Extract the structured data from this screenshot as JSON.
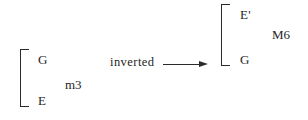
{
  "figure": {
    "type": "music-interval-inversion-diagram",
    "background_color": "#ffffff",
    "ink_color": "#2b2b2b"
  },
  "left_group": {
    "bracket": "square-bracket",
    "top_note": "G",
    "bottom_note": "E",
    "interval_label": "m3"
  },
  "operation": {
    "label": "inverted",
    "arrow": "right-arrow"
  },
  "right_group": {
    "bracket": "square-bracket",
    "top_note": "E'",
    "bottom_note": "G",
    "interval_label": "M6"
  }
}
